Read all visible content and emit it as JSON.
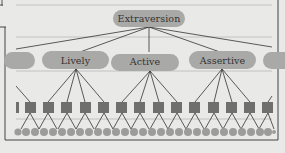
{
  "diagram": {
    "top_node": {
      "label": "Extraversion"
    },
    "mid_nodes": [
      {
        "label": ""
      },
      {
        "label": "Lively"
      },
      {
        "label": "Active"
      },
      {
        "label": "Assertive"
      },
      {
        "label": ""
      }
    ],
    "habit_level": {
      "count_visible": 14,
      "shape": "square"
    },
    "response_level": {
      "count_visible": 29,
      "shape": "circle"
    },
    "colors": {
      "background": "#e9e9e7",
      "frame": "#555555",
      "guide_line": "#b8b8b8",
      "oval_fill": "#a9a9a7",
      "square_fill": "#6f6f6d",
      "circle_fill": "#9c9c9a",
      "connector": "#333333",
      "text": "#333333"
    }
  }
}
